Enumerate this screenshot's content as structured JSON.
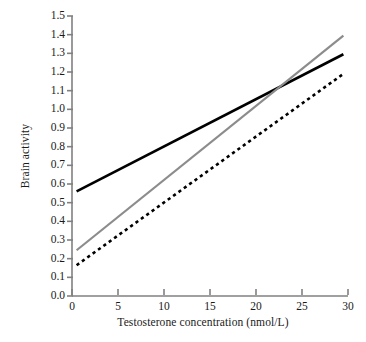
{
  "chart_data": {
    "type": "line",
    "title": "",
    "xlabel": "Testosterone concentration (nmol/L)",
    "ylabel": "Brain activity",
    "xlim": [
      0,
      30
    ],
    "ylim": [
      0.0,
      1.5
    ],
    "xticks": [
      0,
      5,
      10,
      15,
      20,
      25,
      30
    ],
    "xtick_labels": [
      "0",
      "5",
      "10",
      "15",
      "20",
      "25",
      "30"
    ],
    "yticks": [
      0.0,
      0.1,
      0.2,
      0.3,
      0.4,
      0.5,
      0.6,
      0.7,
      0.8,
      0.9,
      1.0,
      1.1,
      1.2,
      1.3,
      1.4,
      1.5
    ],
    "ytick_labels": [
      "0.0",
      "0.1",
      "0.2",
      "0.3",
      "0.4",
      "0.5",
      "0.6",
      "0.7",
      "0.8",
      "0.9",
      "1.0",
      "1.1",
      "1.2",
      "1.3",
      "1.4",
      "1.5"
    ],
    "grid": false,
    "legend": "none",
    "axis_color": "#808080",
    "series": [
      {
        "name": "black-solid-line",
        "style": "solid",
        "color": "#000000",
        "width": 2.6,
        "x": [
          0.5,
          29.5
        ],
        "y": [
          0.56,
          1.295
        ]
      },
      {
        "name": "gray-solid-line",
        "style": "solid",
        "color": "#8c8c8c",
        "width": 2.2,
        "x": [
          0.5,
          29.5
        ],
        "y": [
          0.245,
          1.395
        ]
      },
      {
        "name": "black-dashed-line",
        "style": "dashed",
        "color": "#000000",
        "width": 2.6,
        "x": [
          0.5,
          29.5
        ],
        "y": [
          0.165,
          1.19
        ]
      }
    ],
    "annotations": [],
    "crossing_point": {
      "x": 21.7,
      "y": 1.11
    }
  },
  "axes": {
    "y_title": "Brain activity",
    "x_title": "Testosterone concentration (nmol/L)"
  }
}
